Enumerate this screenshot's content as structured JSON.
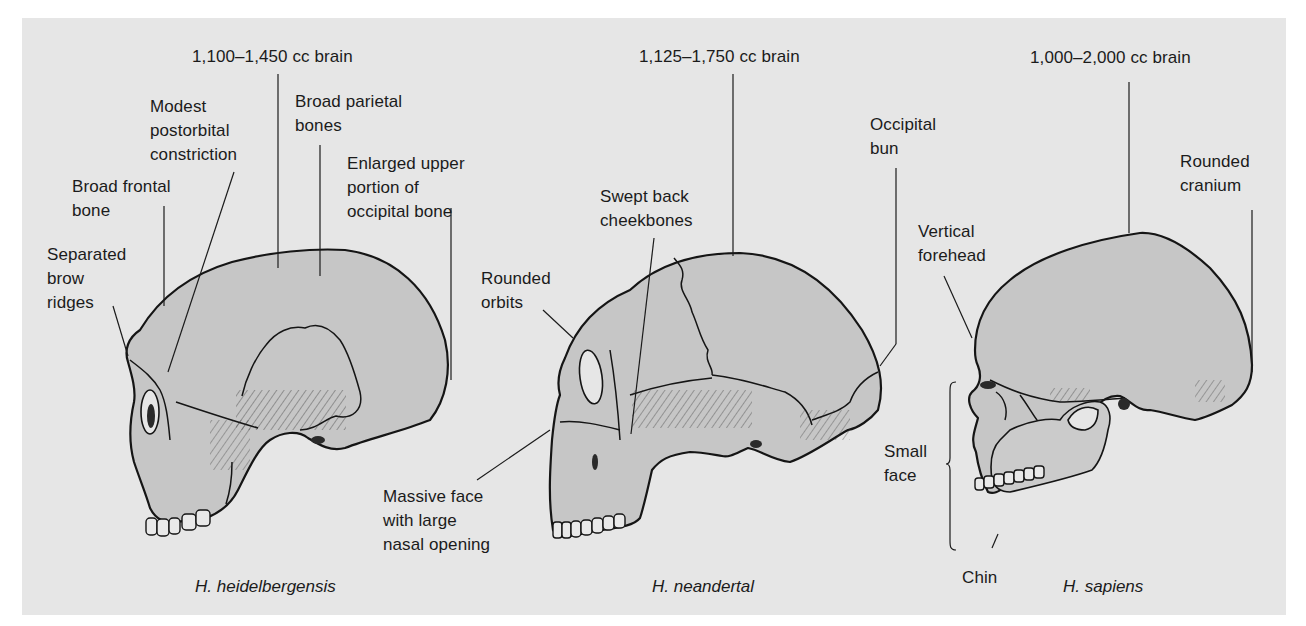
{
  "figure": {
    "colors": {
      "page_background": "#ffffff",
      "panel_background": "#e6e6e6",
      "bone_fill": "#c6c6c6",
      "outline": "#151515"
    },
    "skulls": [
      {
        "species": "H. heidelbergensis",
        "labels": {
          "brain": "1,100–1,450 cc brain",
          "postorbital": "Modest\npostorbital\nconstriction",
          "parietal": "Broad parietal\nbones",
          "occipital": "Enlarged upper\nportion of\noccipital bone",
          "frontal": "Broad frontal\nbone",
          "brow": "Separated\nbrow\nridges"
        }
      },
      {
        "species": "H. neandertal",
        "labels": {
          "brain": "1,125–1,750 cc brain",
          "cheekbones": "Swept back\ncheekbones",
          "occipital_bun": "Occipital\nbun",
          "orbits": "Rounded\norbits",
          "face": "Massive face\nwith large\nnasal opening"
        }
      },
      {
        "species": "H. sapiens",
        "labels": {
          "brain": "1,000–2,000 cc brain",
          "cranium": "Rounded\ncranium",
          "forehead": "Vertical\nforehead",
          "face": "Small\nface",
          "chin": "Chin"
        }
      }
    ]
  }
}
